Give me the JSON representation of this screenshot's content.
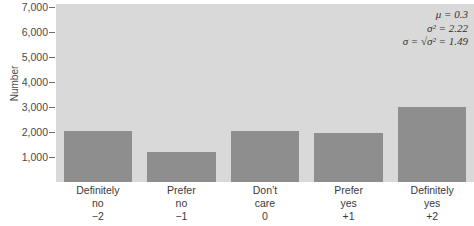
{
  "chart_data": {
    "type": "bar",
    "title": "",
    "xlabel": "",
    "ylabel": "Number",
    "ylim": [
      0,
      7500
    ],
    "grid": false,
    "legend": null,
    "categories": [
      "Definitely no -2",
      "Prefer no -1",
      "Don't care 0",
      "Prefer yes +1",
      "Definitely yes +2"
    ],
    "values": [
      2050,
      1200,
      2050,
      1950,
      3000
    ],
    "ytick_labels": [
      "1,000",
      "2,000",
      "3,000",
      "4,000",
      "5,000",
      "6,000",
      "7,000"
    ],
    "ytick_values": [
      1000,
      2000,
      3000,
      4000,
      5000,
      6000,
      7000
    ],
    "annotations": {
      "mean_label": "μ = 0.3",
      "variance_label": "σ² = 2.22",
      "sigma_prefix": "σ = ",
      "sigma_radical": "√",
      "sigma_radicand": "σ²",
      "sigma_suffix": " = 1.49",
      "mean_value": 0.3,
      "variance_value": 2.22,
      "sigma_value": 1.49
    },
    "colors": {
      "bar_fill": "#8e8e8e",
      "plot_background": "#d9d9d9",
      "page_background": "#ffffff",
      "text": "#3a3a3a"
    }
  },
  "xcategories": [
    {
      "line1": "Definitely",
      "line2": "no",
      "line3": "−2"
    },
    {
      "line1": "Prefer",
      "line2": "no",
      "line3": "−1"
    },
    {
      "line1": "Don’t",
      "line2": "care",
      "line3": "0"
    },
    {
      "line1": "Prefer",
      "line2": "yes",
      "line3": "+1"
    },
    {
      "line1": "Definitely",
      "line2": "yes",
      "line3": "+2"
    }
  ]
}
